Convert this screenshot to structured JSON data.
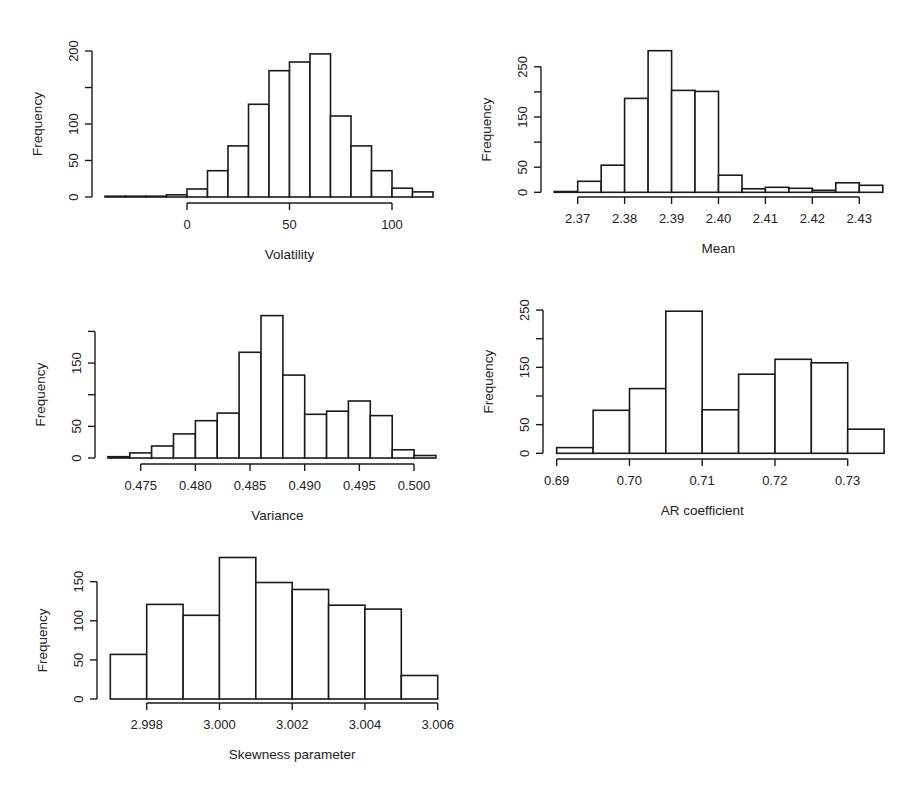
{
  "chart_data": [
    {
      "id": "volatility",
      "type": "bar",
      "subtype": "histogram",
      "title": "",
      "xlabel": "Volatility",
      "ylabel": "Frequency",
      "bin_width": 10,
      "bin_edges": [
        -40,
        -30,
        -20,
        -10,
        0,
        10,
        20,
        30,
        40,
        50,
        60,
        70,
        80,
        90,
        100,
        110,
        120
      ],
      "values": [
        1,
        0,
        1,
        3,
        11,
        36,
        70,
        127,
        173,
        185,
        196,
        111,
        70,
        36,
        12,
        7
      ],
      "xticks": [
        0,
        50,
        100
      ],
      "xtick_labels": [
        "0",
        "50",
        "100"
      ],
      "yticks": [
        0,
        50,
        100,
        150,
        200
      ],
      "ytick_labels": [
        "0",
        "50",
        "100",
        "",
        "200"
      ],
      "ylim": [
        0,
        200
      ],
      "grid": false,
      "layout": {
        "x0": 187,
        "px_per_unit": 2.05,
        "y0": 197,
        "py_per_unit": 0.73,
        "yaxis_x": 92,
        "xaxis_y": 203
      }
    },
    {
      "id": "mean",
      "type": "bar",
      "subtype": "histogram",
      "title": "",
      "xlabel": "Mean",
      "ylabel": "Frequency",
      "bin_width": 0.005,
      "bin_edges": [
        2.365,
        2.37,
        2.375,
        2.38,
        2.385,
        2.39,
        2.395,
        2.4,
        2.405,
        2.41,
        2.415,
        2.42,
        2.425,
        2.43,
        2.435
      ],
      "values": [
        1,
        22,
        54,
        187,
        282,
        203,
        201,
        34,
        7,
        10,
        8,
        4,
        19,
        14
      ],
      "xticks": [
        2.37,
        2.38,
        2.39,
        2.4,
        2.41,
        2.42,
        2.43
      ],
      "xtick_labels": [
        "2.37",
        "2.38",
        "2.39",
        "2.40",
        "2.41",
        "2.42",
        "2.43"
      ],
      "yticks": [
        0,
        50,
        100,
        150,
        200,
        250
      ],
      "ytick_labels": [
        "0",
        "50",
        "",
        "150",
        "",
        "250"
      ],
      "ylim": [
        0,
        280
      ],
      "grid": false,
      "layout": {
        "x0": 577.7,
        "x0_value": 2.37,
        "px_per_unit": 4693,
        "y0": 192.3,
        "py_per_unit": 0.502,
        "yaxis_x": 541,
        "xaxis_y": 197
      }
    },
    {
      "id": "variance",
      "type": "bar",
      "subtype": "histogram",
      "title": "",
      "xlabel": "Variance",
      "ylabel": "Frequency",
      "bin_width": 0.002,
      "bin_edges": [
        0.472,
        0.474,
        0.476,
        0.478,
        0.48,
        0.482,
        0.484,
        0.486,
        0.488,
        0.49,
        0.492,
        0.494,
        0.496,
        0.498,
        0.5,
        0.502
      ],
      "values": [
        2,
        8,
        19,
        38,
        59,
        71,
        167,
        225,
        131,
        69,
        74,
        90,
        67,
        13,
        4
      ],
      "xticks": [
        0.475,
        0.48,
        0.485,
        0.49,
        0.495,
        0.5
      ],
      "xtick_labels": [
        "0.475",
        "0.480",
        "0.485",
        "0.490",
        "0.495",
        "0.500"
      ],
      "yticks": [
        0,
        50,
        100,
        150,
        200
      ],
      "ytick_labels": [
        "0",
        "50",
        "",
        "150",
        ""
      ],
      "ylim": [
        0,
        225
      ],
      "grid": false,
      "layout": {
        "x0": 140.7,
        "x0_value": 0.475,
        "px_per_unit": 10933,
        "y0": 458,
        "py_per_unit": 0.633,
        "yaxis_x": 95,
        "xaxis_y": 464
      }
    },
    {
      "id": "ar_coefficient",
      "type": "bar",
      "subtype": "histogram",
      "title": "",
      "xlabel": "AR coefficient",
      "ylabel": "Frequency",
      "bin_width": 0.005,
      "bin_edges": [
        0.69,
        0.695,
        0.7,
        0.705,
        0.71,
        0.715,
        0.72,
        0.725,
        0.73,
        0.735
      ],
      "values": [
        10,
        75,
        113,
        248,
        76,
        138,
        164,
        158,
        42
      ],
      "xticks": [
        0.69,
        0.7,
        0.71,
        0.72,
        0.73
      ],
      "xtick_labels": [
        "0.69",
        "0.70",
        "0.71",
        "0.72",
        "0.73"
      ],
      "yticks": [
        0,
        50,
        100,
        150,
        200,
        250
      ],
      "ytick_labels": [
        "0",
        "50",
        "",
        "150",
        "",
        "250"
      ],
      "ylim": [
        0,
        250
      ],
      "grid": false,
      "layout": {
        "x0": 556.7,
        "x0_value": 0.69,
        "px_per_unit": 7275,
        "y0": 453.3,
        "py_per_unit": 0.573,
        "yaxis_x": 543,
        "xaxis_y": 459
      }
    },
    {
      "id": "skewness_parameter",
      "type": "bar",
      "subtype": "histogram",
      "title": "",
      "xlabel": "Skewness parameter",
      "ylabel": "Frequency",
      "bin_width": 0.001,
      "bin_edges": [
        2.997,
        2.998,
        2.999,
        3.0,
        3.001,
        3.002,
        3.003,
        3.004,
        3.005,
        3.006
      ],
      "values": [
        57,
        121,
        107,
        181,
        149,
        140,
        120,
        115,
        30
      ],
      "xticks": [
        2.998,
        3.0,
        3.002,
        3.004,
        3.006
      ],
      "xtick_labels": [
        "2.998",
        "3.000",
        "3.002",
        "3.004",
        "3.006"
      ],
      "yticks": [
        0,
        50,
        100,
        150
      ],
      "ytick_labels": [
        "0",
        "50",
        "100",
        "150"
      ],
      "ylim": [
        0,
        181
      ],
      "grid": false,
      "layout": {
        "x0": 146.7,
        "x0_value": 2.998,
        "px_per_unit": 36375,
        "y0": 699,
        "py_per_unit": 0.782,
        "yaxis_x": 97,
        "xaxis_y": 703
      }
    }
  ]
}
